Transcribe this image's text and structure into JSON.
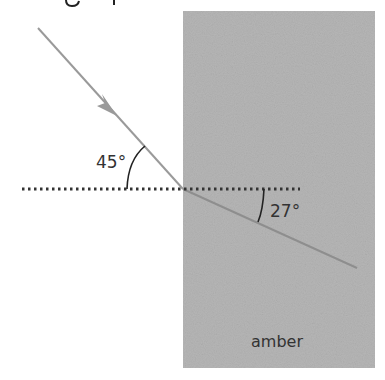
{
  "diagram": {
    "type": "refraction",
    "partial_heading": "…g…p…",
    "medium": {
      "label": "amber",
      "color": "#b4b4b4"
    },
    "incident_angle": {
      "label": "45°",
      "value_deg": 45
    },
    "refracted_angle": {
      "label": "27°",
      "value_deg": 27
    },
    "ray_color": "#9a9a9a",
    "normal_line_style": "dotted",
    "arrow_direction": "toward-surface"
  }
}
